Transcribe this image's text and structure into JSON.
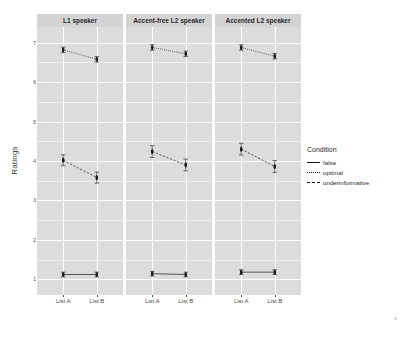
{
  "chart_data": {
    "type": "line",
    "title": "",
    "xlabel": "",
    "ylabel": "Ratings",
    "ylim": [
      0.6,
      7.4
    ],
    "yticks": [
      1,
      2,
      3,
      4,
      5,
      6,
      7
    ],
    "ytick_labels": [
      "1",
      "2",
      "3",
      "4",
      "5",
      "6",
      "7"
    ],
    "grid": true,
    "categories": [
      "List A",
      "List B"
    ],
    "legend_title": "Condition",
    "legend_position": "right",
    "facet_var": "speaker",
    "facets": [
      {
        "label": "L1 speaker",
        "series": [
          {
            "name": "false",
            "linestyle": "solid",
            "values": [
              1.12,
              1.12
            ],
            "errors": [
              0.06,
              0.06
            ]
          },
          {
            "name": "optimal",
            "linestyle": "dotted",
            "values": [
              6.82,
              6.58
            ],
            "errors": [
              0.07,
              0.07
            ]
          },
          {
            "name": "underinformative",
            "linestyle": "dashed",
            "values": [
              4.02,
              3.58
            ],
            "errors": [
              0.14,
              0.14
            ]
          }
        ]
      },
      {
        "label": "Accent-free L2 speaker",
        "series": [
          {
            "name": "false",
            "linestyle": "solid",
            "values": [
              1.14,
              1.12
            ],
            "errors": [
              0.06,
              0.06
            ]
          },
          {
            "name": "optimal",
            "linestyle": "dotted",
            "values": [
              6.88,
              6.72
            ],
            "errors": [
              0.07,
              0.07
            ]
          },
          {
            "name": "underinformative",
            "linestyle": "dashed",
            "values": [
              4.24,
              3.9
            ],
            "errors": [
              0.15,
              0.15
            ]
          }
        ]
      },
      {
        "label": "Accented L2 speaker",
        "series": [
          {
            "name": "false",
            "linestyle": "solid",
            "values": [
              1.18,
              1.18
            ],
            "errors": [
              0.06,
              0.06
            ]
          },
          {
            "name": "optimal",
            "linestyle": "dotted",
            "values": [
              6.88,
              6.66
            ],
            "errors": [
              0.07,
              0.07
            ]
          },
          {
            "name": "underinformative",
            "linestyle": "dashed",
            "values": [
              4.3,
              3.86
            ],
            "errors": [
              0.15,
              0.15
            ]
          }
        ]
      }
    ],
    "legend_entries": [
      {
        "label": "false",
        "linestyle": "solid"
      },
      {
        "label": "optimal",
        "linestyle": "dotted"
      },
      {
        "label": "underinformative",
        "linestyle": "dashed"
      }
    ],
    "colors": {
      "panel_background": "#dcdcdc",
      "strip_background": "#d4d4d4",
      "gridline_major": "#ffffff",
      "gridline_minor": "#f0f0f0",
      "series": "#1a1a1a",
      "text": "#2b2b2b",
      "figure_background": "#ffffff"
    }
  },
  "caption": "",
  "chevron_glyph": "‹"
}
